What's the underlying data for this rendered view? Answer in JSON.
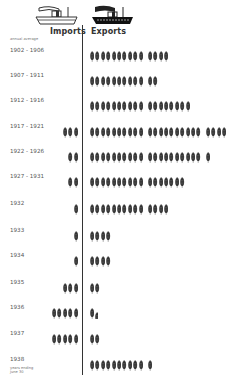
{
  "header": {
    "imports_label": "Imports",
    "exports_label": "Exports",
    "imports_ship_icon": "ship-outline-icon",
    "exports_ship_icon": "ship-filled-icon"
  },
  "notes": {
    "top": "annual average",
    "bottom": "years ending June 30"
  },
  "unit_icon": "wheat-icon",
  "colors": {
    "ink": "#2a2a2a",
    "background": "#ffffff"
  },
  "chart_data": {
    "type": "bar",
    "subtype": "pictograph",
    "title": "",
    "unit": "wheat sheaf icon",
    "xlabel": "",
    "ylabel": "",
    "categories": [
      "1902 - 1906",
      "1907 - 1911",
      "1912 - 1916",
      "1917 - 1921",
      "1922 - 1926",
      "1927 - 1931",
      "1932",
      "1933",
      "1934",
      "1935",
      "1936",
      "1937",
      "1938"
    ],
    "series": [
      {
        "name": "Imports",
        "values": [
          0,
          0,
          0,
          3,
          2,
          2,
          1,
          1,
          1,
          3,
          5,
          5,
          0
        ]
      },
      {
        "name": "Exports",
        "values": [
          14,
          12,
          18,
          24,
          21,
          17,
          14,
          4,
          4,
          2,
          1.5,
          2,
          11
        ]
      }
    ],
    "annotations": [
      "annual average (1902 - 1931 periods)",
      "years ending June 30 (1938)"
    ],
    "legend": "column headers with ship icons: Imports (outline ship), Exports (solid ship)",
    "grid": false
  },
  "rows": [
    {
      "label": "1902 - 1906",
      "top": 49
    },
    {
      "label": "1907 - 1911",
      "top": 74
    },
    {
      "label": "1912 - 1916",
      "top": 99
    },
    {
      "label": "1917 - 1921",
      "top": 125
    },
    {
      "label": "1922 - 1926",
      "top": 150
    },
    {
      "label": "1927 - 1931",
      "top": 175
    },
    {
      "label": "1932",
      "top": 202
    },
    {
      "label": "1933",
      "top": 229
    },
    {
      "label": "1934",
      "top": 254
    },
    {
      "label": "1935",
      "top": 281
    },
    {
      "label": "1936",
      "top": 306
    },
    {
      "label": "1937",
      "top": 332
    },
    {
      "label": "1938",
      "top": 358
    }
  ]
}
